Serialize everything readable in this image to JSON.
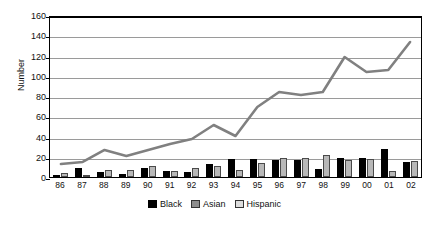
{
  "chart_data": {
    "type": "bar",
    "title": "",
    "xlabel": "",
    "ylabel": "Number",
    "ylim": [
      0,
      160
    ],
    "yticks": [
      0,
      20,
      40,
      60,
      80,
      100,
      120,
      140,
      160
    ],
    "grid": true,
    "legend_position": "bottom",
    "categories": [
      "86",
      "87",
      "88",
      "89",
      "90",
      "91",
      "92",
      "93",
      "94",
      "95",
      "96",
      "97",
      "98",
      "99",
      "00",
      "01",
      "02"
    ],
    "series": [
      {
        "name": "Black",
        "type": "bar",
        "color": "#000000",
        "values": [
          2,
          9,
          5,
          3,
          9,
          6,
          5,
          13,
          18,
          18,
          17,
          17,
          8,
          19,
          19,
          28,
          15
        ]
      },
      {
        "name": "Asian",
        "type": "bar",
        "color": "#b8b8b8",
        "values": [
          4,
          0,
          7,
          7,
          11,
          6,
          9,
          11,
          7,
          14,
          19,
          19,
          22,
          17,
          18,
          6,
          16
        ]
      },
      {
        "name": "Hispanic",
        "type": "line",
        "color": "#808080",
        "values": [
          13,
          15,
          27,
          21,
          27,
          33,
          38,
          52,
          41,
          70,
          85,
          82,
          85,
          120,
          105,
          107,
          135
        ]
      }
    ]
  },
  "legend": {
    "items": [
      {
        "label": "Black",
        "swatch": "black-swatch"
      },
      {
        "label": "Asian",
        "swatch": "asian-swatch"
      },
      {
        "label": "Hispanic",
        "swatch": "hispanic-swatch"
      }
    ]
  }
}
